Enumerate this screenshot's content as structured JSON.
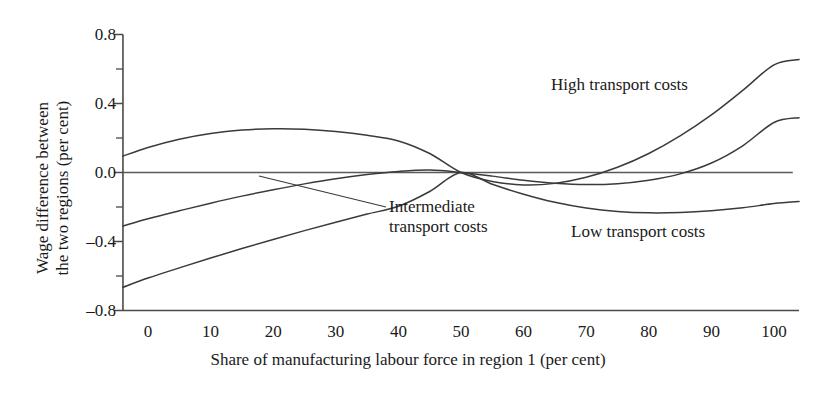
{
  "chart_data": {
    "type": "line",
    "title": "",
    "xlabel": "Share of manufacturing labour force in region 1 (per cent)",
    "ylabel": "Wage difference between the two regions (per cent)",
    "xlim": [
      -4,
      104
    ],
    "ylim": [
      -0.8,
      0.8
    ],
    "xticks": [
      0,
      10,
      20,
      30,
      40,
      50,
      60,
      70,
      80,
      90,
      100
    ],
    "xtick_labels": [
      "0",
      "10",
      "20",
      "30",
      "40",
      "50",
      "60",
      "70",
      "80",
      "90",
      "100"
    ],
    "yticks": [
      -0.8,
      -0.4,
      0.0,
      0.4,
      0.8
    ],
    "ytick_labels": [
      "–0.8",
      "–0.4",
      "0.0",
      "0.4",
      "0.8"
    ],
    "y_minor_ticks": [
      -0.6,
      -0.2,
      0.2,
      0.6
    ],
    "grid": false,
    "legend": "inline-annotations",
    "zero_reference_line": true,
    "x": [
      -4,
      0,
      5,
      10,
      15,
      20,
      25,
      30,
      35,
      40,
      45,
      50,
      55,
      60,
      65,
      70,
      75,
      80,
      85,
      90,
      95,
      100,
      104
    ],
    "series": [
      {
        "name": "High transport costs",
        "label_position": "upper-right",
        "values": [
          0.095,
          0.145,
          0.193,
          0.226,
          0.246,
          0.254,
          0.251,
          0.238,
          0.216,
          0.183,
          0.11,
          0.0,
          -0.052,
          -0.072,
          -0.063,
          -0.028,
          0.03,
          0.11,
          0.212,
          0.334,
          0.476,
          0.624,
          0.655
        ]
      },
      {
        "name": "Intermediate transport costs",
        "label_position": "center-left",
        "values": [
          -0.31,
          -0.268,
          -0.222,
          -0.178,
          -0.137,
          -0.1,
          -0.066,
          -0.036,
          -0.012,
          0.006,
          0.014,
          0.0,
          -0.021,
          -0.045,
          -0.062,
          -0.07,
          -0.065,
          -0.045,
          -0.008,
          0.055,
          0.155,
          0.29,
          0.318
        ]
      },
      {
        "name": "Low transport costs",
        "label_position": "lower-right",
        "values": [
          -0.665,
          -0.612,
          -0.553,
          -0.496,
          -0.441,
          -0.388,
          -0.337,
          -0.288,
          -0.241,
          -0.196,
          -0.11,
          0.0,
          -0.068,
          -0.126,
          -0.173,
          -0.206,
          -0.226,
          -0.234,
          -0.232,
          -0.222,
          -0.205,
          -0.18,
          -0.168
        ]
      }
    ],
    "annotations": [
      {
        "id": "high",
        "text": "High transport costs"
      },
      {
        "id": "intermediate",
        "line1": "Intermediate",
        "line2": "transport costs",
        "leader_line": true
      },
      {
        "id": "low",
        "text": "Low transport costs"
      }
    ],
    "colors": {
      "curve": "#3a3a3a",
      "axis": "#4a4a4a",
      "background": "#ffffff",
      "text": "#1a1a1a"
    }
  },
  "axes": {
    "y_title_line1": "Wage difference between",
    "y_title_line2": "the two regions (per cent)",
    "x_title": "Share of manufacturing labour force in region 1 (per cent)"
  },
  "annotations": {
    "high": "High transport costs",
    "intermediate_line1": "Intermediate",
    "intermediate_line2": "transport costs",
    "low": "Low transport costs"
  }
}
